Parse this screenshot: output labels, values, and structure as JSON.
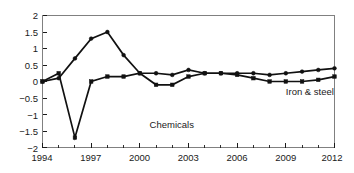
{
  "chart_data": {
    "type": "line",
    "title": "",
    "subtitle": "",
    "xlabel": "",
    "ylabel": "",
    "x": [
      1994,
      1995,
      1996,
      1997,
      1998,
      1999,
      2000,
      2001,
      2002,
      2003,
      2004,
      2005,
      2006,
      2007,
      2008,
      2009,
      2010,
      2011,
      2012
    ],
    "xlim": [
      1994,
      2012
    ],
    "ylim": [
      -2,
      2
    ],
    "grid": false,
    "legend_position": "inline-annotations",
    "x_tick_labels": [
      "1994",
      "1997",
      "2000",
      "2003",
      "2006",
      "2009",
      "2012"
    ],
    "x_tick_values": [
      1994,
      1997,
      2000,
      2003,
      2006,
      2009,
      2012
    ],
    "x_minor_tick_values": [
      1995,
      1996,
      1998,
      1999,
      2001,
      2002,
      2004,
      2005,
      2007,
      2008,
      2010,
      2011
    ],
    "y_tick_labels": [
      "2",
      "1.5",
      "1",
      "0.5",
      "0",
      "−0.5",
      "−1",
      "−1.5",
      "−2"
    ],
    "y_tick_values": [
      2,
      1.5,
      1,
      0.5,
      0,
      -0.5,
      -1,
      -1.5,
      -2
    ],
    "series": [
      {
        "name": "Chemicals",
        "marker": "square",
        "label_x": 2000.6,
        "label_y": -1.42,
        "values": [
          0,
          0.25,
          -1.7,
          0,
          0.15,
          0.15,
          0.25,
          -0.1,
          -0.1,
          0.15,
          0.25,
          0.25,
          0.2,
          0.1,
          0,
          0,
          0,
          0.05,
          0.15
        ]
      },
      {
        "name": "Iron & steel",
        "marker": "circle",
        "label_x": 2009.0,
        "label_y": -0.42,
        "values": [
          0,
          0.1,
          0.7,
          1.3,
          1.5,
          0.8,
          0.25,
          0.25,
          0.2,
          0.35,
          0.25,
          0.25,
          0.25,
          0.25,
          0.2,
          0.25,
          0.3,
          0.35,
          0.4
        ]
      }
    ],
    "annotations": [
      {
        "text": "Chemicals",
        "x": 2000.6,
        "y": -1.42
      },
      {
        "text": "Iron & steel",
        "x": 2009.0,
        "y": -0.42
      }
    ]
  },
  "labels": {
    "series_chemicals": "Chemicals",
    "series_iron_steel": "Iron & steel",
    "y0": "2",
    "y1": "1.5",
    "y2": "1",
    "y3": "0.5",
    "y4": "0",
    "y5": "−0.5",
    "y6": "−1",
    "y7": "−1.5",
    "y8": "−2",
    "x0": "1994",
    "x1": "1997",
    "x2": "2000",
    "x3": "2003",
    "x4": "2006",
    "x5": "2009",
    "x6": "2012"
  },
  "colors": {
    "series_stroke": "#111111",
    "axis": "#808080",
    "text": "#1a1a1a",
    "background": "#ffffff"
  }
}
